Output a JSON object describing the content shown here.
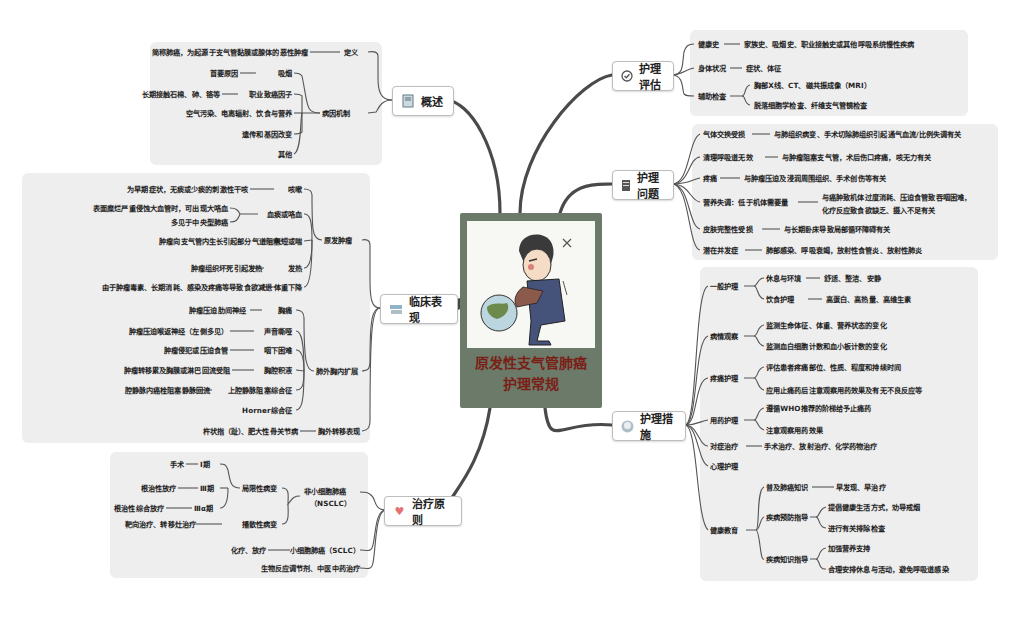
{
  "center": {
    "title_line1": "原发性支气管肺癌",
    "title_line2": "护理常规",
    "image": "patient-coughing-illustration"
  },
  "colors": {
    "panel_bg": "#eeeeee",
    "link": "#555555",
    "center_bg": "#6b7a69",
    "center_title": "#7a1f18",
    "branch_border": "#bdbdbd"
  },
  "branches": {
    "overview": {
      "label": "概述",
      "icon": "document-icon",
      "definition_label": "定义",
      "definition_text": "简称肺癌，为起源于支气管黏膜或腺体的恶性肿瘤",
      "etiology_label": "病因机制",
      "etiology": [
        {
          "label": "吸烟",
          "detail": "首要原因"
        },
        {
          "label": "职业致癌因子",
          "detail": "长期接触石棉、砷、铬等"
        },
        {
          "label": "空气污染、电离辐射、饮食与营养",
          "detail": ""
        },
        {
          "label": "遗传和基因改变",
          "detail": ""
        },
        {
          "label": "其他",
          "detail": ""
        }
      ]
    },
    "clinical": {
      "label": "临床表现",
      "icon": "books-icon",
      "primary_label": "原发肿瘤",
      "primary": [
        {
          "label": "咳嗽",
          "detail": "为早期症状，无痰或少痰的刺激性干咳"
        },
        {
          "label": "血痰或咯血",
          "details": [
            "表面糜烂严重侵蚀大血管时，可出现大咯血",
            "多见于中央型肺癌"
          ]
        },
        {
          "label": "气短或喘",
          "detail": "肿瘤向支气管内生长引起部分气道阻塞"
        },
        {
          "label": "发热",
          "detail": "肿瘤组织坏死引起发热"
        },
        {
          "label": "体重下降",
          "detail": "由于肿瘤毒素、长期消耗、感染及疼痛等导致食欲减退"
        }
      ],
      "local_label": "肺外胸内扩展",
      "local": [
        {
          "label": "胸痛",
          "detail": "肿瘤压迫肋间神经"
        },
        {
          "label": "声音嘶哑",
          "detail": "肿瘤压迫喉返神经（左侧多见）"
        },
        {
          "label": "咽下困难",
          "detail": "肿瘤侵犯或压迫食管"
        },
        {
          "label": "胸腔积液",
          "detail": "肿瘤转移累及胸膜或淋巴回流受阻"
        },
        {
          "label": "上腔静脉阻塞综合征",
          "detail": "腔静脉内癌栓阻塞静脉回流"
        },
        {
          "label": "Horner综合征",
          "detail": ""
        }
      ],
      "metastasis_label": "胸外转移表现",
      "metastasis_detail": "杵状指（趾）、肥大性骨关节病"
    },
    "treatment": {
      "label": "治疗原则",
      "icon": "heart-icon",
      "nsclc_label_1": "非小细胞肺癌",
      "nsclc_label_2": "（NSCLC）",
      "localized_label": "局限性病变",
      "stages": [
        {
          "stage": "Ⅰ期",
          "treatment": "手术"
        },
        {
          "stage": "Ⅲ期",
          "treatment": "根治性放疗"
        },
        {
          "stage": "Ⅲα期",
          "treatment": "根治性综合放疗"
        }
      ],
      "disseminated_label": "播散性病变",
      "disseminated_detail": "靶向治疗、转移灶治疗",
      "sclc_label": "小细胞肺癌（SCLC）",
      "sclc_detail": "化疗、放疗",
      "other": "生物反应调节剂、中医中药治疗"
    },
    "assessment": {
      "label": "护理评估",
      "icon": "check-circle-icon",
      "items": [
        {
          "label": "健康史",
          "detail": "家族史、吸烟史、职业接触史或其他呼吸系统慢性疾病"
        },
        {
          "label": "身体状况",
          "detail": "症状、体征"
        },
        {
          "label": "辅助检查",
          "details": [
            "胸部X线、CT、磁共振成像（MRI）",
            "脱落细胞学检查、纤维支气管镜检查"
          ]
        }
      ]
    },
    "problems": {
      "label": "护理问题",
      "icon": "notebook-icon",
      "items": [
        {
          "label": "气体交换受损",
          "detail": "与肺组织病变、手术切除肺组织引起通气血流/比例失调有关"
        },
        {
          "label": "清理呼吸道无效",
          "detail": "与肿瘤阻塞支气管，术后伤口疼痛，咳无力有关"
        },
        {
          "label": "疼痛",
          "detail": "与肿瘤压迫及浸润周围组织、手术创伤等有关"
        },
        {
          "label": "营养失调：低于机体需要量",
          "detail_1": "与癌肿致机体过度消耗、压迫食管致吞咽困难，",
          "detail_2": "化疗反应致食欲缺乏、摄入不足有关"
        },
        {
          "label": "皮肤完整性受损",
          "detail": "与长期卧床导致局部循环障碍有关"
        },
        {
          "label": "潜在并发症",
          "detail": "肺部感染、呼吸衰竭，放射性食管炎、放射性肺炎"
        }
      ]
    },
    "measures": {
      "label": "护理措施",
      "icon": "face-icon",
      "general_label": "一般护理",
      "general": [
        {
          "label": "休息与环境",
          "detail": "舒适、整洁、安静"
        },
        {
          "label": "饮食护理",
          "detail": "高蛋白、高热量、高维生素"
        }
      ],
      "observe_label": "病情观察",
      "observe": [
        "监测生命体征、体重、营养状态的变化",
        "监测血白细胞计数和血小板计数的变化"
      ],
      "pain_label": "疼痛护理",
      "pain": [
        "评估患者疼痛部位、性质、程度和持续时间",
        "应用止痛药后注意观察用药效果及有无不良反应等"
      ],
      "drug_label": "用药护理",
      "drug": [
        "遵循WHO推荐的阶梯给予止痛药",
        "注意观察用药效果"
      ],
      "symptomatic_label": "对症治疗",
      "symptomatic_detail": "手术治疗、放射治疗、化学药物治疗",
      "psych_label": "心理护理",
      "edu_label": "健康教育",
      "edu_knowledge_label": "普及肺癌知识",
      "edu_knowledge_detail": "早发现、早治疗",
      "edu_prevent_label": "疾病预防指导",
      "edu_prevent": [
        "提倡健康生活方式，劝导戒烟",
        "进行有关排除检查"
      ],
      "edu_disease_label": "疾病知识指导",
      "edu_disease": [
        "加强营养支持",
        "合理安排休息与活动，避免呼吸道感染"
      ]
    }
  }
}
